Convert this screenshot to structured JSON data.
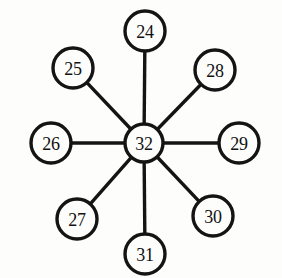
{
  "diagram": {
    "type": "star-graph",
    "background_color": "#fdfdfc",
    "stroke_color": "#141414",
    "label_color": "#111111",
    "center": {
      "id": "center",
      "label": "32",
      "cx": 144,
      "cy": 143,
      "r": 19
    },
    "nodes": [
      {
        "id": "n24",
        "label": "24",
        "cx": 145,
        "cy": 31,
        "r": 20,
        "angle_deg": 90
      },
      {
        "id": "n25",
        "label": "25",
        "cx": 73,
        "cy": 68,
        "r": 20,
        "angle_deg": 135
      },
      {
        "id": "n26",
        "label": "26",
        "cx": 51,
        "cy": 143,
        "r": 20,
        "angle_deg": 180
      },
      {
        "id": "n27",
        "label": "27",
        "cx": 77,
        "cy": 219,
        "r": 20,
        "angle_deg": 225
      },
      {
        "id": "n28",
        "label": "28",
        "cx": 215,
        "cy": 70,
        "r": 20,
        "angle_deg": 45
      },
      {
        "id": "n29",
        "label": "29",
        "cx": 239,
        "cy": 143,
        "r": 20,
        "angle_deg": 0
      },
      {
        "id": "n30",
        "label": "30",
        "cx": 213,
        "cy": 216,
        "r": 20,
        "angle_deg": 315
      },
      {
        "id": "n31",
        "label": "31",
        "cx": 145,
        "cy": 254,
        "r": 20,
        "angle_deg": 270
      }
    ],
    "edges": [
      {
        "id": "e-center-24",
        "from": "center",
        "to": "n24"
      },
      {
        "id": "e-center-25",
        "from": "center",
        "to": "n25"
      },
      {
        "id": "e-center-26",
        "from": "center",
        "to": "n26"
      },
      {
        "id": "e-center-27",
        "from": "center",
        "to": "n27"
      },
      {
        "id": "e-center-28",
        "from": "center",
        "to": "n28"
      },
      {
        "id": "e-center-29",
        "from": "center",
        "to": "n29"
      },
      {
        "id": "e-center-30",
        "from": "center",
        "to": "n30"
      },
      {
        "id": "e-center-31",
        "from": "center",
        "to": "n31"
      }
    ]
  }
}
